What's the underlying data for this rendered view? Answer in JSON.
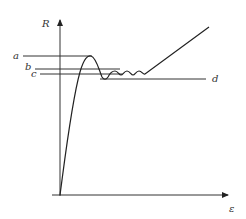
{
  "diagram": {
    "type": "stress-strain curve",
    "y_axis_label": "R",
    "x_axis_label": "ε",
    "levels": [
      {
        "label": "a",
        "y": 56
      },
      {
        "label": "b",
        "y": 69
      },
      {
        "label": "c",
        "y": 74
      },
      {
        "label": "d",
        "y": 79
      }
    ],
    "colors": {
      "line": "#333333",
      "background": "#ffffff"
    }
  }
}
